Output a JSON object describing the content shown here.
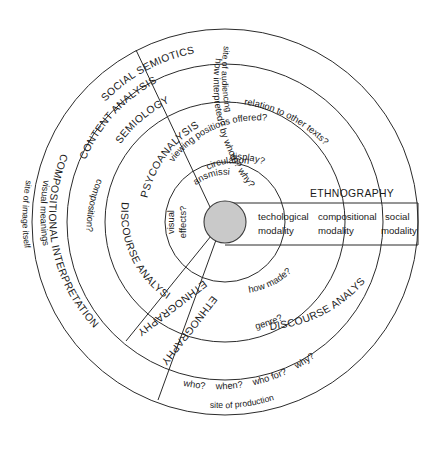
{
  "diagram": {
    "type": "concentric-circle-diagram",
    "center": {
      "label": ""
    },
    "modalities": [
      {
        "id": "technological",
        "line1": "techological",
        "line2": "modality"
      },
      {
        "id": "compositional",
        "line1": "compositional",
        "line2": "modality"
      },
      {
        "id": "social",
        "line1": "social",
        "line2": "modality"
      }
    ],
    "methods": {
      "social_semiotics": "SOCIAL SEMIOTICS",
      "semiology": "SEMIOLOGY",
      "content_analysis": "CONTENT ANALYSIS",
      "psycoanalysis": "PSYCOANALYSIS",
      "compositional_interpretation": "COMPOSITIONAL INTERPRETATION",
      "discourse_analysis_1": "DISCOURSE ANALYSIS I",
      "discourse_analysis_2": "DISCOURSE ANALYSIS II",
      "ethnography_band": "ETHNOGRAPHY",
      "ethnography_radial_1": "ETHNOGRAPHY",
      "ethnography_radial_2": "ETHNOGRAPHY"
    },
    "sites": {
      "image_itself": "site of image itself",
      "audiencing": "site of audiencing",
      "production": "site of production"
    },
    "questions": {
      "visual_meanings": "visual meanings",
      "composition": "composition?",
      "visual_effects": "visual effects?",
      "visual_effects_l1": "visual",
      "visual_effects_l2": "effects?",
      "transmission": "transmission?",
      "circulation": "circulation?",
      "display": "display?",
      "viewing_positions": "viewing positions offered?",
      "relation_texts": "relation to other texts?",
      "how_interpreted": "how interpreted?  by whom?  why?",
      "how_made": "how made?",
      "genre": "genre?",
      "who": "who?",
      "when": "when?",
      "who_for": "who for?",
      "why": "why?"
    },
    "colors": {
      "stroke": "#2b2b2b",
      "center_fill": "#c9c9c9",
      "background": "#ffffff",
      "text": "#1a1a1a"
    },
    "geometry": {
      "cx": 225,
      "cy": 222,
      "r_center": 21,
      "r_ring1": 60,
      "r_ring2": 120,
      "r_ring3": 158,
      "r_ring4": 193
    }
  }
}
